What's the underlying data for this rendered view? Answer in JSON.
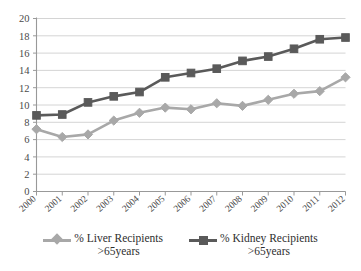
{
  "chart_data": {
    "type": "line",
    "title": "",
    "subtitle": "",
    "xlabel": "",
    "ylabel": "",
    "categories": [
      "2000",
      "2001",
      "2002",
      "2003",
      "2004",
      "2005",
      "2006",
      "2007",
      "2008",
      "2009",
      "2010",
      "2011",
      "2012"
    ],
    "ylim": [
      0,
      20
    ],
    "ytick_values": [
      0,
      2,
      4,
      6,
      8,
      10,
      12,
      14,
      16,
      18,
      20
    ],
    "ytick_labels": [
      "0",
      "2",
      "4",
      "6",
      "8",
      "10",
      "12",
      "14",
      "16",
      "18",
      "20"
    ],
    "grid": "horizontal",
    "legend_position": "bottom",
    "series": [
      {
        "name": "% Liver Recipients\n>65years",
        "marker": "diamond",
        "color": "#a8a8a8",
        "values": [
          7.2,
          6.3,
          6.6,
          8.2,
          9.1,
          9.7,
          9.5,
          10.2,
          9.9,
          10.6,
          11.3,
          11.6,
          13.2
        ]
      },
      {
        "name": "% Kidney Recipients\n>65years",
        "marker": "square",
        "color": "#5a5a5a",
        "values": [
          8.8,
          8.9,
          10.3,
          11.0,
          11.5,
          13.2,
          13.7,
          14.2,
          15.1,
          15.6,
          16.5,
          17.6,
          17.8
        ]
      }
    ]
  },
  "legend": {
    "items": [
      {
        "label": "% Liver Recipients\n>65years",
        "color": "#a8a8a8",
        "marker": "diamond"
      },
      {
        "label": "% Kidney Recipients\n>65years",
        "color": "#5a5a5a",
        "marker": "square"
      }
    ]
  },
  "axes": {
    "axis_color": "#999999",
    "grid_color": "#c9c9c9",
    "tick_label_color": "#4a4a4a"
  }
}
